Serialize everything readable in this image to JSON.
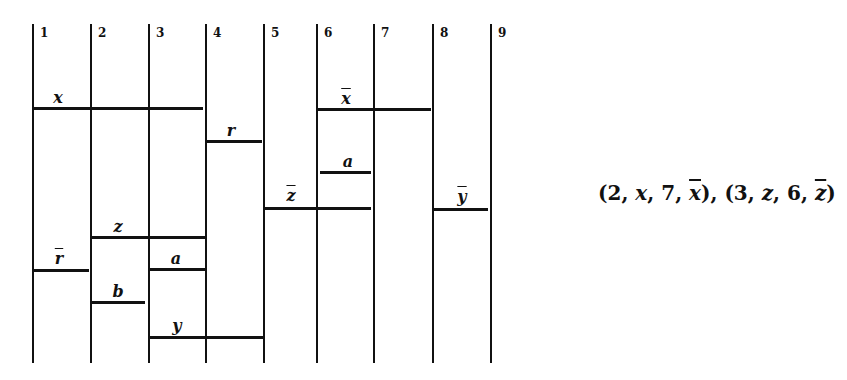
{
  "diagram": {
    "columns": [
      {
        "label": "1",
        "x": 33
      },
      {
        "label": "2",
        "x": 91
      },
      {
        "label": "3",
        "x": 149
      },
      {
        "label": "4",
        "x": 206
      },
      {
        "label": "5",
        "x": 264
      },
      {
        "label": "6",
        "x": 317
      },
      {
        "label": "7",
        "x": 374
      },
      {
        "label": "8",
        "x": 433
      },
      {
        "label": "9",
        "x": 491
      }
    ],
    "line_top": 24,
    "line_bottom": 363,
    "segments": [
      {
        "label": "x",
        "bar": false,
        "from_col": 1,
        "to_col": 4,
        "x1": 33,
        "x2": 203,
        "y": 108,
        "lx": 58,
        "ly": 90
      },
      {
        "label": "r",
        "bar": false,
        "from_col": 4,
        "to_col": 5,
        "x1": 206,
        "x2": 262,
        "y": 141,
        "lx": 231,
        "ly": 123
      },
      {
        "label": "x",
        "bar": true,
        "from_col": 6,
        "to_col": 8,
        "x1": 317,
        "x2": 431,
        "y": 109,
        "lx": 346,
        "ly": 91
      },
      {
        "label": "a",
        "bar": false,
        "from_col": 6,
        "to_col": 7,
        "x1": 320,
        "x2": 371,
        "y": 172,
        "lx": 348,
        "ly": 154
      },
      {
        "label": "z",
        "bar": true,
        "from_col": 5,
        "to_col": 7,
        "x1": 264,
        "x2": 371,
        "y": 208,
        "lx": 291,
        "ly": 188
      },
      {
        "label": "y",
        "bar": true,
        "from_col": 8,
        "to_col": 9,
        "x1": 433,
        "x2": 488,
        "y": 209,
        "lx": 462,
        "ly": 189
      },
      {
        "label": "z",
        "bar": false,
        "from_col": 2,
        "to_col": 4,
        "x1": 91,
        "x2": 205,
        "y": 237,
        "lx": 118,
        "ly": 219
      },
      {
        "label": "r",
        "bar": true,
        "from_col": 1,
        "to_col": 2,
        "x1": 33,
        "x2": 89,
        "y": 270,
        "lx": 59,
        "ly": 251
      },
      {
        "label": "a",
        "bar": false,
        "from_col": 3,
        "to_col": 4,
        "x1": 149,
        "x2": 205,
        "y": 269,
        "lx": 176,
        "ly": 251
      },
      {
        "label": "b",
        "bar": false,
        "from_col": 2,
        "to_col": 3,
        "x1": 91,
        "x2": 145,
        "y": 302,
        "lx": 118,
        "ly": 284
      },
      {
        "label": "y",
        "bar": false,
        "from_col": 3,
        "to_col": 5,
        "x1": 149,
        "x2": 264,
        "y": 337,
        "lx": 177,
        "ly": 318
      }
    ]
  },
  "expression": {
    "tuples": [
      {
        "a": "2",
        "b": "x",
        "c": "7",
        "d": "x",
        "d_bar": true
      },
      {
        "a": "3",
        "b": "z",
        "c": "6",
        "d": "z",
        "d_bar": true
      }
    ],
    "text": "(2, x, 7, x̄), (3, z, 6, z̄)"
  }
}
